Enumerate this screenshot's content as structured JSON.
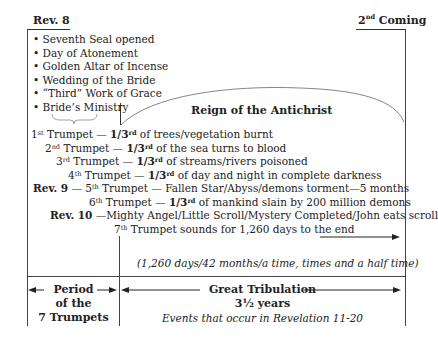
{
  "headers": {
    "left": "Rev. 8",
    "right_sup": "nd",
    "right_num": "2",
    "right_word": "Coming"
  },
  "bullets": [
    "Seventh Seal opened",
    "Day of Atonement",
    "Golden Altar of Incense",
    "Wedding of the Bride",
    "“Third” Work of Grace",
    "Bride’s Ministry"
  ],
  "arc_label": "Reign of the Antichrist",
  "trumpets": [
    {
      "prefix": "",
      "num": "1",
      "sup": "st",
      "word": " Trumpet — ",
      "frac": "1/3",
      "frac_sup": "rd",
      "rest": " of trees/vegetation burnt"
    },
    {
      "prefix": "",
      "num": "2",
      "sup": "nd",
      "word": " Trumpet — ",
      "frac": "1/3",
      "frac_sup": "rd",
      "rest": " of the sea turns to blood"
    },
    {
      "prefix": "",
      "num": "3",
      "sup": "rd",
      "word": " Trumpet — ",
      "frac": "1/3",
      "frac_sup": "rd",
      "rest": " of streams/rivers poisoned"
    },
    {
      "prefix": "",
      "num": "4",
      "sup": "th",
      "word": " Trumpet — ",
      "frac": "1/3",
      "frac_sup": "rd",
      "rest": " of day and night in complete darkness"
    },
    {
      "prefix": "Rev. 9",
      "num": " — 5",
      "sup": "th",
      "word": " Trumpet — Fallen Star/Abyss/demons torment—5 months",
      "frac": "",
      "frac_sup": "",
      "rest": ""
    },
    {
      "prefix": "",
      "num": "6",
      "sup": "th",
      "word": " Trumpet — ",
      "frac": "1/3",
      "frac_sup": "rd",
      "rest": " of mankind slain by 200 million demons"
    },
    {
      "prefix": "Rev. 10",
      "num": " —Mighty Angel/Little Scroll/Mystery Completed/John eats scroll",
      "sup": "",
      "word": "",
      "frac": "",
      "frac_sup": "",
      "rest": ""
    },
    {
      "prefix": "",
      "num": "7",
      "sup": "th",
      "word": " Trumpet sounds for 1,260 days to the end",
      "frac": "",
      "frac_sup": "",
      "rest": ""
    }
  ],
  "time_note": "(1,260 days/42 months/a time, times and a half time)",
  "bottom_left": {
    "line1": "Period",
    "line2": "of the",
    "line3": "7 Trumpets"
  },
  "bottom_right": {
    "title": "Great Tribulation",
    "years": "3½ years",
    "note": "Events that occur in Revelation 11-20"
  }
}
